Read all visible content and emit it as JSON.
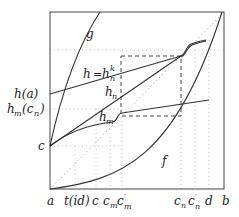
{
  "diagram": {
    "frame": {
      "x0": 50,
      "y0": 12,
      "x1": 224,
      "y1": 189
    },
    "curves": {
      "g": "g",
      "f": "f",
      "h": "h",
      "hk": "k",
      "hn": "h",
      "hn_sub": "n",
      "hm": "h",
      "hm_sub": "m",
      "h_eq": "="
    },
    "left_labels": {
      "h_a": "h(a)",
      "hm_cn_h": "h",
      "hm_cn_sub": "m",
      "hm_cn_arg": "(c",
      "hm_cn_argsub": "n",
      "hm_cn_close": ")",
      "c": "c"
    },
    "bottom_labels": {
      "a": "a",
      "t_id": "t(id)",
      "c": "c",
      "c_m": "c",
      "c_m_sub": "m",
      "c_m_prime": "c",
      "c_m_prime_mark": "′",
      "c_m_prime_sub": "m",
      "c_n": "c",
      "c_n_sub": "n",
      "c_n_prime": "c",
      "c_n_prime_mark": "′",
      "c_n_prime_sub": "n",
      "d": "d",
      "b": "b"
    }
  }
}
